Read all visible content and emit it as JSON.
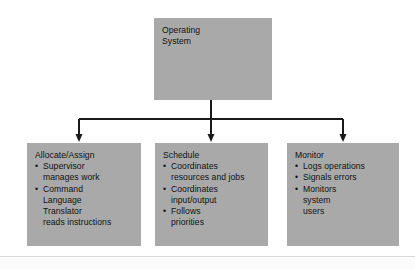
{
  "figure": {
    "background_color": "#ffffff",
    "box_fill_color": "#a9a9a9",
    "text_color": "#111111",
    "connector_color": "#1a1a1a"
  },
  "root": {
    "label": "Operating\nSystem"
  },
  "branches": [
    {
      "id": "allocate",
      "title": "Allocate/Assign",
      "items": [
        {
          "text": "Supervisor\nmanages work",
          "marker": true
        },
        {
          "text": "Command\nLanguage\nTranslator",
          "marker": true
        },
        {
          "text": "reads instructions",
          "marker": false
        }
      ]
    },
    {
      "id": "schedule",
      "title": "Schedule",
      "items": [
        {
          "text": "Coordinates\nresources and jobs",
          "marker": true
        },
        {
          "text": "Coordinates\ninput/output",
          "marker": true
        },
        {
          "text": "Follows\npriorities",
          "marker": true
        }
      ]
    },
    {
      "id": "monitor",
      "title": "Monitor",
      "items": [
        {
          "text": "Logs operations",
          "marker": true
        },
        {
          "text": "Signals errors",
          "marker": true
        },
        {
          "text": "Monitors\nsystem\nusers",
          "marker": true
        }
      ]
    }
  ]
}
